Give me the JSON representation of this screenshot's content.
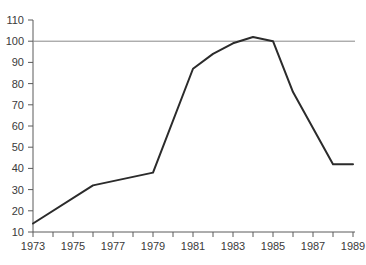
{
  "chart_data": {
    "type": "line",
    "title": "",
    "subtitle": "",
    "xlabel": "",
    "ylabel": "",
    "xlim": [
      1973,
      1989
    ],
    "ylim": [
      10,
      110
    ],
    "grid": false,
    "legend": null,
    "x_tick_labels": [
      "1973",
      "1975",
      "1977",
      "1979",
      "1981",
      "1983",
      "1985",
      "1987",
      "1989"
    ],
    "x_tick_values": [
      1973,
      1975,
      1977,
      1979,
      1981,
      1983,
      1985,
      1987,
      1989
    ],
    "x_minor_ticks": [
      1974,
      1976,
      1978,
      1980,
      1982,
      1984,
      1986,
      1988
    ],
    "y_tick_labels": [
      "10",
      "20",
      "30",
      "40",
      "50",
      "60",
      "70",
      "80",
      "90",
      "100",
      "110"
    ],
    "y_tick_values": [
      10,
      20,
      30,
      40,
      50,
      60,
      70,
      80,
      90,
      100,
      110
    ],
    "x": [
      1973,
      1976,
      1979,
      1981,
      1982,
      1983,
      1984,
      1985,
      1986,
      1988,
      1989
    ],
    "values": [
      14,
      32,
      38,
      87,
      94,
      99,
      102,
      100,
      76,
      42,
      42
    ],
    "series": [
      {
        "name": "series-1",
        "x": [
          1973,
          1976,
          1979,
          1981,
          1982,
          1983,
          1984,
          1985,
          1986,
          1988,
          1989
        ],
        "values": [
          14,
          32,
          38,
          87,
          94,
          99,
          102,
          100,
          76,
          42,
          42
        ],
        "color": "#2b2b2b",
        "width": 2
      }
    ],
    "reference_line": {
      "name": "reference-line-100",
      "orientation": "horizontal",
      "value": 100,
      "color": "#888888",
      "width": 1
    },
    "axis_color": "#5a5a5a",
    "text_color": "#3a3a3a",
    "background": "#ffffff"
  }
}
